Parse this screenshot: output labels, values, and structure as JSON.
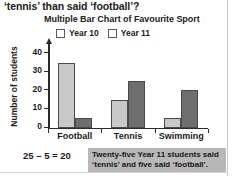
{
  "question_fragment": "‘tennis’ than said ‘football’?",
  "legend": {
    "entries": [
      {
        "label": "Year 10",
        "color": "#c8c8c8"
      },
      {
        "label": "Year 11",
        "color": "#6e6e6e"
      }
    ]
  },
  "annotation": {
    "calculation": "25 – 5 = 20",
    "callout_line1": "Twenty-five Year 11 students said",
    "callout_line2": "‘tennis’ and five said ‘football’."
  },
  "chart_data": {
    "type": "bar",
    "title": "Multiple Bar Chart of Favourite Sport",
    "xlabel": "",
    "ylabel": "Number of students",
    "categories": [
      "Football",
      "Tennis",
      "Swimming"
    ],
    "series": [
      {
        "name": "Year 10",
        "color": "#c8c8c8",
        "values": [
          35,
          15,
          5
        ]
      },
      {
        "name": "Year 11",
        "color": "#6e6e6e",
        "values": [
          5,
          25,
          20
        ]
      }
    ],
    "ylim": [
      0,
      45
    ],
    "yticks": [
      0,
      10,
      20,
      30,
      40
    ],
    "grid": false,
    "legend_position": "top"
  }
}
